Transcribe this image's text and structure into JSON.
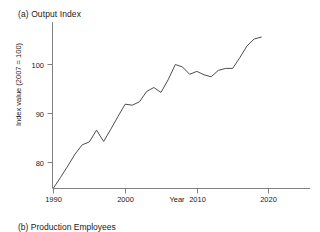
{
  "panel_a": {
    "title": "(a) Output Index"
  },
  "panel_b": {
    "title": "(b) Production Employees"
  },
  "axes": {
    "xlabel": "Year",
    "ylabel": "Index value (2007 = 100)",
    "ytick_labels": [
      "100",
      "90",
      "80"
    ],
    "xtick_labels": [
      "1990",
      "2000",
      "2010",
      "2020"
    ]
  },
  "style": {
    "line_color": "#4d4d4d",
    "axis_color": "#808080",
    "background": "#ffffff"
  },
  "chart_data": {
    "type": "line",
    "title": "(a) Output Index",
    "xlabel": "Year",
    "ylabel": "Index value (2007 = 100)",
    "xlim": [
      1989,
      1989.5
    ],
    "x_range": [
      1989,
      2022
    ],
    "ylim": [
      73,
      108
    ],
    "yticks": [
      80,
      90,
      100
    ],
    "xticks": [
      1990,
      2000,
      2010,
      2020
    ],
    "grid": false,
    "legend": "none",
    "series": [
      {
        "name": "Output Index",
        "x": [
          1990,
          1991,
          1992,
          1993,
          1994,
          1995,
          1996,
          1997,
          1998,
          1999,
          2000,
          2001,
          2002,
          2003,
          2004,
          2005,
          2006,
          2007,
          2008,
          2009,
          2010,
          2011,
          2012,
          2013,
          2014,
          2015,
          2016,
          2017,
          2018,
          2019
        ],
        "values": [
          74.8,
          77.0,
          79.3,
          81.7,
          83.6,
          84.2,
          86.6,
          84.3,
          86.8,
          89.4,
          91.9,
          91.7,
          92.4,
          94.5,
          95.3,
          94.3,
          96.9,
          100.0,
          99.5,
          98.0,
          98.6,
          97.9,
          97.5,
          98.8,
          99.2,
          99.2,
          101.4,
          103.8,
          105.2,
          105.6
        ]
      }
    ]
  }
}
